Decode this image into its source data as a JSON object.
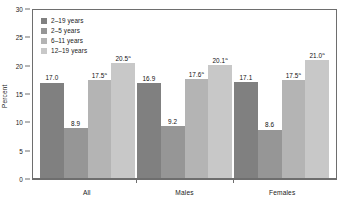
{
  "chart_data": {
    "type": "bar",
    "title": "",
    "xlabel": "",
    "ylabel": "Percent",
    "ylim": [
      0,
      30
    ],
    "yticks": [
      0,
      5,
      10,
      15,
      20,
      25,
      30
    ],
    "grid": false,
    "legend_position": "top-left-inside",
    "categories": [
      "All",
      "Males",
      "Females"
    ],
    "series": [
      {
        "name": "2–19 years",
        "color": "#808080",
        "values": [
          17.0,
          16.9,
          17.1
        ],
        "labels": [
          "17.0",
          "16.9",
          "17.1"
        ],
        "footnotes": [
          "",
          "",
          ""
        ]
      },
      {
        "name": "2–5 years",
        "color": "#969696",
        "values": [
          8.9,
          9.2,
          8.6
        ],
        "labels": [
          "8.9",
          "9.2",
          "8.6"
        ],
        "footnotes": [
          "",
          "",
          ""
        ]
      },
      {
        "name": "6–11 years",
        "color": "#b4b4b4",
        "values": [
          17.5,
          17.6,
          17.5
        ],
        "labels": [
          "17.5",
          "17.6",
          "17.5"
        ],
        "footnotes": [
          "a",
          "a",
          "a"
        ]
      },
      {
        "name": "12–19 years",
        "color": "#c8c8c8",
        "values": [
          20.5,
          20.1,
          21.0
        ],
        "labels": [
          "20.5",
          "20.1",
          "21.0"
        ],
        "footnotes": [
          "a",
          "a",
          "a"
        ]
      }
    ]
  },
  "axis": {
    "y_title": "Percent",
    "y_ticks": [
      "30",
      "25",
      "20",
      "15",
      "10",
      "5",
      "0"
    ]
  },
  "legend": {
    "items": [
      {
        "label": "2–19 years"
      },
      {
        "label": "2–5 years"
      },
      {
        "label": "6–11 years"
      },
      {
        "label": "12–19 years"
      }
    ]
  },
  "groups": [
    {
      "label": "All"
    },
    {
      "label": "Males"
    },
    {
      "label": "Females"
    }
  ]
}
